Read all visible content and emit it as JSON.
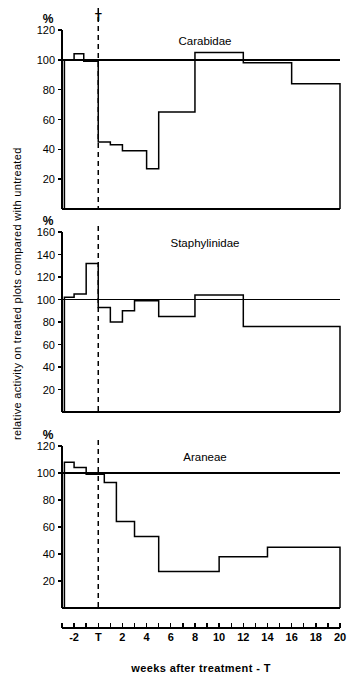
{
  "figure": {
    "y_axis_title": "relative activity on treated plots compared with untreated",
    "x_axis_title": "weeks  after  treatment - T",
    "percent_symbol": "%",
    "treatment_marker": "T"
  },
  "x_axis": {
    "min": -3,
    "max": 20,
    "tick_step": 1,
    "labels": [
      {
        "value": -2,
        "text": "-2"
      },
      {
        "value": 0,
        "text": "T"
      },
      {
        "value": 2,
        "text": "2"
      },
      {
        "value": 4,
        "text": "4"
      },
      {
        "value": 6,
        "text": "6"
      },
      {
        "value": 8,
        "text": "8"
      },
      {
        "value": 10,
        "text": "10"
      },
      {
        "value": 12,
        "text": "12"
      },
      {
        "value": 14,
        "text": "14"
      },
      {
        "value": 16,
        "text": "16"
      },
      {
        "value": 18,
        "text": "18"
      },
      {
        "value": 20,
        "text": "20"
      }
    ]
  },
  "chart_data": [
    {
      "type": "area",
      "title": "Carabidae",
      "xlabel": "weeks after treatment - T",
      "ylabel": "relative activity on treated plots compared with untreated",
      "unit": "%",
      "xlim": [
        -3,
        20
      ],
      "ylim": [
        0,
        120
      ],
      "yticks": [
        20,
        40,
        60,
        80,
        100,
        120
      ],
      "ytick_labels": [
        "20",
        "40",
        "60",
        "80",
        "100",
        "120"
      ],
      "grid": false,
      "reference_line": 100,
      "treatment_line_x": 0,
      "steps": [
        {
          "x_start": -2.8,
          "x_end": -2.0,
          "value": 100
        },
        {
          "x_start": -2.0,
          "x_end": -1.2,
          "value": 104
        },
        {
          "x_start": -1.2,
          "x_end": 0.0,
          "value": 99
        },
        {
          "x_start": 0.0,
          "x_end": 1.0,
          "value": 45
        },
        {
          "x_start": 1.0,
          "x_end": 2.0,
          "value": 43
        },
        {
          "x_start": 2.0,
          "x_end": 4.0,
          "value": 39
        },
        {
          "x_start": 4.0,
          "x_end": 5.0,
          "value": 27
        },
        {
          "x_start": 5.0,
          "x_end": 8.0,
          "value": 65
        },
        {
          "x_start": 8.0,
          "x_end": 12.0,
          "value": 105
        },
        {
          "x_start": 12.0,
          "x_end": 16.0,
          "value": 98
        },
        {
          "x_start": 16.0,
          "x_end": 20.0,
          "value": 84
        }
      ]
    },
    {
      "type": "area",
      "title": "Staphylinidae",
      "xlabel": "weeks after treatment - T",
      "ylabel": "relative activity on treated plots compared with untreated",
      "unit": "%",
      "xlim": [
        -3,
        20
      ],
      "ylim": [
        0,
        160
      ],
      "yticks": [
        20,
        40,
        60,
        80,
        100,
        120,
        140,
        160
      ],
      "ytick_labels": [
        "20",
        "40",
        "60",
        "80",
        "100",
        "120",
        "140",
        "160"
      ],
      "grid": false,
      "reference_line": 100,
      "treatment_line_x": 0,
      "steps": [
        {
          "x_start": -2.8,
          "x_end": -2.0,
          "value": 102
        },
        {
          "x_start": -2.0,
          "x_end": -1.0,
          "value": 105
        },
        {
          "x_start": -1.0,
          "x_end": 0.0,
          "value": 132
        },
        {
          "x_start": 0.0,
          "x_end": 1.0,
          "value": 93
        },
        {
          "x_start": 1.0,
          "x_end": 2.0,
          "value": 80
        },
        {
          "x_start": 2.0,
          "x_end": 3.0,
          "value": 90
        },
        {
          "x_start": 3.0,
          "x_end": 5.0,
          "value": 99
        },
        {
          "x_start": 5.0,
          "x_end": 8.0,
          "value": 85
        },
        {
          "x_start": 8.0,
          "x_end": 12.0,
          "value": 104
        },
        {
          "x_start": 12.0,
          "x_end": 16.0,
          "value": 76
        },
        {
          "x_start": 16.0,
          "x_end": 20.0,
          "value": 76
        }
      ]
    },
    {
      "type": "area",
      "title": "Araneae",
      "xlabel": "weeks after treatment - T",
      "ylabel": "relative activity on treated plots compared with untreated",
      "unit": "%",
      "xlim": [
        -3,
        20
      ],
      "ylim": [
        0,
        120
      ],
      "yticks": [
        20,
        40,
        60,
        80,
        100,
        120
      ],
      "ytick_labels": [
        "20",
        "40",
        "60",
        "80",
        "100",
        "120"
      ],
      "grid": false,
      "reference_line": 100,
      "treatment_line_x": 0,
      "steps": [
        {
          "x_start": -2.8,
          "x_end": -2.0,
          "value": 108
        },
        {
          "x_start": -2.0,
          "x_end": -1.0,
          "value": 104
        },
        {
          "x_start": -1.0,
          "x_end": 0.5,
          "value": 99
        },
        {
          "x_start": 0.5,
          "x_end": 1.5,
          "value": 93
        },
        {
          "x_start": 1.5,
          "x_end": 3.0,
          "value": 64
        },
        {
          "x_start": 3.0,
          "x_end": 5.0,
          "value": 53
        },
        {
          "x_start": 5.0,
          "x_end": 10.0,
          "value": 27
        },
        {
          "x_start": 10.0,
          "x_end": 14.0,
          "value": 38
        },
        {
          "x_start": 14.0,
          "x_end": 20.0,
          "value": 45
        }
      ]
    }
  ]
}
